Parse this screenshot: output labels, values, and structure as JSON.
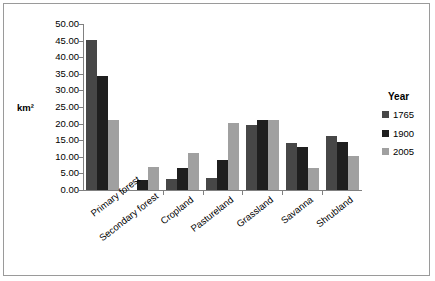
{
  "chart_data": {
    "type": "bar",
    "title": "",
    "xlabel": "",
    "ylabel": "km²",
    "ylim": [
      0,
      50
    ],
    "ytick_step": 5,
    "grid": false,
    "legend_position": "right",
    "legend_title": "Year",
    "categories": [
      "Primary forest",
      "Secondary forest",
      "Cropland",
      "Pastureland",
      "Grassland",
      "Savanna",
      "Shrubland"
    ],
    "ytick_labels": [
      "50.00",
      "45.00",
      "40.00",
      "35.00",
      "30.00",
      "25.00",
      "20.00",
      "15.00",
      "10.00",
      "5.00",
      "0.00"
    ],
    "ytick_values": [
      50,
      45,
      40,
      35,
      30,
      25,
      20,
      15,
      10,
      5,
      0
    ],
    "series": [
      {
        "name": "1765",
        "color": "#474747",
        "values": [
          45.2,
          0.0,
          3.2,
          3.6,
          19.6,
          14.1,
          16.2
        ]
      },
      {
        "name": "1900",
        "color": "#1f1f1f",
        "values": [
          34.2,
          3.0,
          6.6,
          9.0,
          21.0,
          13.1,
          14.6
        ]
      },
      {
        "name": "2005",
        "color": "#a0a0a0",
        "values": [
          21.2,
          7.0,
          11.0,
          20.2,
          21.2,
          6.5,
          10.2
        ]
      }
    ]
  }
}
